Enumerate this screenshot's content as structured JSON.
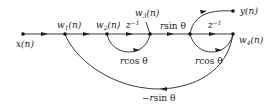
{
  "diagram": {
    "type": "signal-flow-graph",
    "nodes": [
      {
        "id": "x",
        "label": "x(n)"
      },
      {
        "id": "w1",
        "label": "w₁(n)"
      },
      {
        "id": "w2",
        "label": "w₂(n)"
      },
      {
        "id": "w3",
        "label": "w₃(n)"
      },
      {
        "id": "m",
        "label": ""
      },
      {
        "id": "w4",
        "label": "w₄(n)"
      },
      {
        "id": "y",
        "label": "y(n)"
      }
    ],
    "edges": [
      {
        "from": "x",
        "to": "w1",
        "gain": ""
      },
      {
        "from": "w1",
        "to": "w2",
        "gain": ""
      },
      {
        "from": "w2",
        "to": "w3",
        "gain": "z⁻¹"
      },
      {
        "from": "w3",
        "to": "w2",
        "gain": "rcos θ"
      },
      {
        "from": "w3",
        "to": "m",
        "gain": "rsin θ"
      },
      {
        "from": "m",
        "to": "w4",
        "gain": "z⁻¹"
      },
      {
        "from": "w4",
        "to": "m",
        "gain": "rcos θ"
      },
      {
        "from": "m",
        "to": "y",
        "gain": ""
      },
      {
        "from": "w4",
        "to": "w1",
        "gain": "−rsin θ"
      }
    ],
    "labels": {
      "x": "x(n)",
      "w1": "w",
      "w1_sub": "1",
      "w2": "w",
      "w2_sub": "2",
      "w3": "w",
      "w3_sub": "3",
      "w4": "w",
      "w4_sub": "4",
      "arg_n": "(n)",
      "y": "y(n)",
      "z_inv_1": "z",
      "z_inv_2": "z",
      "z_exp": "−1",
      "rsin": "r",
      "sin": "sin θ",
      "rcos1": "r",
      "cos1": "cos θ",
      "rcos2": "r",
      "cos2": "cos θ",
      "neg_rsin": "−r",
      "neg_sin": "sin θ"
    }
  }
}
